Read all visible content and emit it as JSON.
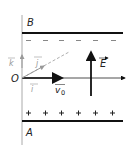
{
  "diagram": {
    "plates": {
      "top": {
        "label": "B",
        "charge_sign": "−",
        "count": 6
      },
      "bottom": {
        "label": "A",
        "charge_sign": "+",
        "count": 6
      }
    },
    "origin_label": "O",
    "field_label": "E",
    "velocity_label": "v0",
    "velocity_subscript": "0",
    "velocity_base": "v",
    "unit_vectors": {
      "i": "i",
      "j": "j",
      "k": "k"
    },
    "colors": {
      "ink": "#111111",
      "grey": "#999999",
      "light": "#bbbbbb"
    }
  }
}
